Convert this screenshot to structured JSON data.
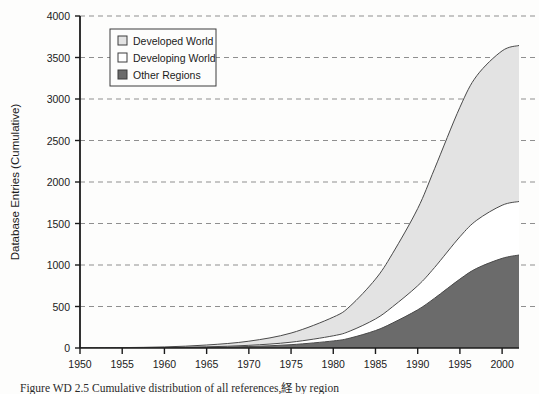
{
  "chart_data": {
    "type": "area",
    "stacked": true,
    "title": "",
    "xlabel": "",
    "ylabel": "Database Entries (Cumulative)",
    "xlim": [
      1950,
      2002
    ],
    "ylim": [
      0,
      4000
    ],
    "grid": true,
    "grid_style": "dashed-horizontal",
    "legend_position": "top-left",
    "xticks": [
      1950,
      1955,
      1960,
      1965,
      1970,
      1975,
      1980,
      1985,
      1990,
      1995,
      2000
    ],
    "yticks": [
      0,
      500,
      1000,
      1500,
      2000,
      2500,
      3000,
      3500,
      4000
    ],
    "x": [
      1950,
      1955,
      1960,
      1965,
      1970,
      1975,
      1980,
      1982,
      1985,
      1987,
      1990,
      1992,
      1995,
      1997,
      2000,
      2002
    ],
    "series": [
      {
        "name": "Other Regions",
        "color": "#6b6b6b",
        "order": "bottom",
        "values": [
          0,
          1,
          3,
          8,
          18,
          40,
          85,
          120,
          210,
          300,
          460,
          600,
          830,
          960,
          1080,
          1120
        ]
      },
      {
        "name": "Developing World",
        "color": "#ffffff",
        "order": "middle",
        "values": [
          0,
          1,
          2,
          6,
          14,
          30,
          62,
          85,
          140,
          195,
          290,
          370,
          510,
          580,
          640,
          645
        ]
      },
      {
        "name": "Developed World",
        "color": "#e3e3e3",
        "order": "top",
        "values": [
          1,
          3,
          8,
          22,
          50,
          110,
          225,
          300,
          480,
          640,
          930,
          1190,
          1560,
          1740,
          1860,
          1880
        ]
      }
    ],
    "cumulative_totals": [
      1,
      5,
      13,
      36,
      82,
      180,
      372,
      505,
      830,
      1135,
      1680,
      2160,
      2900,
      3280,
      3580,
      3645
    ]
  },
  "legend": {
    "items": [
      {
        "label": "Developed World",
        "swatch": "#e3e3e3"
      },
      {
        "label": "Developing World",
        "swatch": "#ffffff"
      },
      {
        "label": "Other Regions",
        "swatch": "#6b6b6b"
      }
    ]
  },
  "axes": {
    "y_title": "Database Entries (Cumulative)",
    "y_tick_labels": [
      "4000",
      "3500",
      "3000",
      "2500",
      "2000",
      "1500",
      "1000",
      "500",
      "0"
    ],
    "x_tick_labels": [
      "1950",
      "1955",
      "1960",
      "1965",
      "1970",
      "1975",
      "1980",
      "1985",
      "1990",
      "1995",
      "2000"
    ]
  },
  "caption": {
    "text": "Figure WD 2.5  Cumulative distribution of all references,経 by region"
  },
  "colors": {
    "axis": "#1b1b1b",
    "gridline": "#8f8f8f",
    "developed": "#e3e3e3",
    "developing": "#ffffff",
    "other": "#6b6b6b",
    "outline": "#4a4a4a",
    "background": "#fdfdfc"
  }
}
